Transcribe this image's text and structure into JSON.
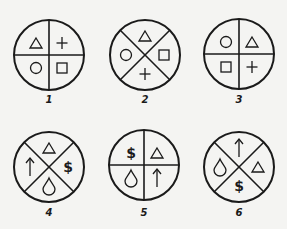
{
  "colors": {
    "ink": "#1a1a1a",
    "paper": "#f4f4f2"
  },
  "figures": [
    {
      "label": "1",
      "division": "plus",
      "cx": 49,
      "cy": 50,
      "quadrants": {
        "top-left": "triangle",
        "top-right": "plus",
        "bottom-left": "circle",
        "bottom-right": "square"
      }
    },
    {
      "label": "2",
      "division": "cross",
      "cx": 145,
      "cy": 50,
      "quadrants": {
        "top": "triangle",
        "right": "square",
        "bottom": "plus",
        "left": "circle"
      }
    },
    {
      "label": "3",
      "division": "plus",
      "cx": 239,
      "cy": 49,
      "quadrants": {
        "top-left": "circle",
        "top-right": "triangle",
        "bottom-left": "square",
        "bottom-right": "plus"
      }
    },
    {
      "label": "4",
      "division": "cross",
      "cx": 49,
      "cy": 162,
      "quadrants": {
        "top": "triangle",
        "right": "dollar",
        "bottom": "drop",
        "left": "arrow-up"
      }
    },
    {
      "label": "5",
      "division": "plus",
      "cx": 144,
      "cy": 160,
      "quadrants": {
        "top-left": "dollar",
        "top-right": "triangle",
        "bottom-left": "drop",
        "bottom-right": "arrow-up"
      }
    },
    {
      "label": "6",
      "division": "cross",
      "cx": 239,
      "cy": 162,
      "quadrants": {
        "top": "arrow-up",
        "right": "triangle",
        "bottom": "dollar",
        "left": "drop"
      }
    }
  ]
}
